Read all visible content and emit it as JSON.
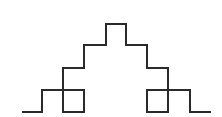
{
  "diagram": {
    "type": "line-drawing",
    "description": "Symmetric stepped staircase curve with two overlapping square loops near the base",
    "stroke_color": "#2a2a2a",
    "background_color": "#ffffff",
    "stroke_width": 2,
    "path_points": [
      [
        22,
        112
      ],
      [
        42,
        112
      ],
      [
        42,
        90
      ],
      [
        84,
        90
      ],
      [
        84,
        112
      ],
      [
        63,
        112
      ],
      [
        63,
        68
      ],
      [
        84,
        68
      ],
      [
        84,
        45
      ],
      [
        106,
        45
      ],
      [
        106,
        24
      ],
      [
        126,
        24
      ],
      [
        126,
        45
      ],
      [
        147,
        45
      ],
      [
        147,
        68
      ],
      [
        168,
        68
      ],
      [
        168,
        112
      ],
      [
        147,
        112
      ],
      [
        147,
        90
      ],
      [
        190,
        90
      ],
      [
        190,
        112
      ],
      [
        211,
        112
      ]
    ]
  }
}
